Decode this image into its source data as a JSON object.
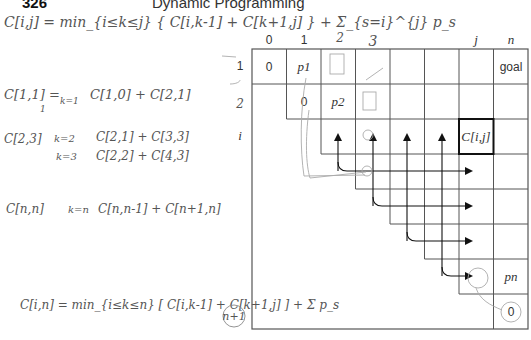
{
  "page": {
    "number": "326",
    "running_header": "Dynamic Programming"
  },
  "notes": {
    "formula_top": "C[i,j] = min_{i≤k≤j} { C[i,k-1] + C[k+1,j] } + Σ_{s=i}^{j} p_s",
    "c11_lhs": "C[1,1] =",
    "c11_k": "k=1",
    "c11_rhs": "C[1,0] + C[2,1]",
    "c11_sub": "1",
    "c23_lhs": "C[2,3]",
    "c23_k2": "k=2",
    "c23_k2_rhs": "C[2,1] + C[3,3]",
    "c23_k3": "k=3",
    "c23_k3_rhs": "C[2,2] + C[4,3]",
    "cnn_lhs": "C[n,n]",
    "cnn_k": "k=n",
    "cnn_rhs": "C[n,n-1] + C[n+1,n]",
    "formula_bottom": "C[i,n] = min_{i≤k≤n} [ C[i,k-1] + C[k+1,j] ] + Σ p_s",
    "circled": "n+1"
  },
  "grid": {
    "col_labels": [
      "0",
      "1",
      "2",
      "3",
      "",
      "",
      "j",
      "n"
    ],
    "col_labels_handwritten": {
      "2": "2",
      "3": "3"
    },
    "row_labels": [
      "1",
      "2",
      "i"
    ],
    "row_labels_handwritten": {
      "1": "2"
    },
    "cells": {
      "r0c0": "0",
      "r0c1": "p1",
      "r0c7": "goal",
      "r1c1": "0",
      "r1c2": "p2",
      "r2c6": "C[i,j]",
      "r6c7": "pn",
      "r7c7": "0"
    },
    "highlight_cell": "C[i,j]",
    "arrows": {
      "vertical_up_columns": [
        2,
        3,
        4,
        5
      ],
      "horizontal_right_rows": [
        3,
        4,
        5,
        6
      ],
      "target_column": 6
    }
  }
}
